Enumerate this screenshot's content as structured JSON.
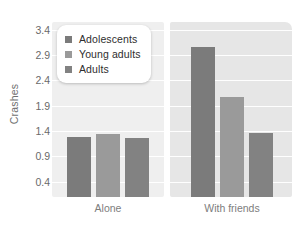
{
  "chart_data": {
    "type": "bar",
    "title": "",
    "xlabel": "",
    "ylabel": "Crashes",
    "categories": [
      "Alone",
      "With friends"
    ],
    "series": [
      {
        "name": "Adolescents",
        "color": "#7b7b7b",
        "values": [
          1.28,
          3.05
        ]
      },
      {
        "name": "Young adults",
        "color": "#9a9a9a",
        "values": [
          1.35,
          2.08
        ]
      },
      {
        "name": "Adults",
        "color": "#828282",
        "values": [
          1.26,
          1.37
        ]
      }
    ],
    "yticks": [
      3.4,
      2.9,
      2.4,
      1.9,
      1.4,
      0.9,
      0.4
    ],
    "ytick_labels": [
      "3.4",
      "2.9",
      "2.4",
      "1.9",
      "1.4",
      "0.9",
      "0.4"
    ],
    "ylim": [
      0.1,
      3.55
    ],
    "grid": "horizontal",
    "legend_position": "top-left"
  },
  "legend": {
    "items": [
      {
        "label": "Adolescents",
        "color": "#7b7b7b"
      },
      {
        "label": "Young adults",
        "color": "#9a9a9a"
      },
      {
        "label": "Adults",
        "color": "#828282"
      }
    ]
  },
  "axes": {
    "y_title": "Crashes",
    "x_categories": [
      "Alone",
      "With friends"
    ]
  },
  "colors": {
    "panel_left": "#efefef",
    "panel_right": "#e6e6e6",
    "gridline": "#ffffff",
    "tick_text": "#6a6a6a",
    "axis_title": "#6f6f6f",
    "x_label": "#7d7d7d"
  }
}
